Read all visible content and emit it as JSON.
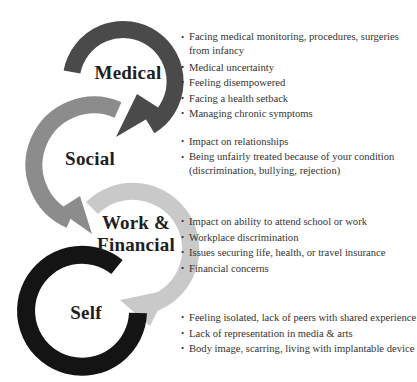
{
  "colors": {
    "medical": "#4a4a4a",
    "social": "#8c8c8c",
    "work_financial": "#c9c9c9",
    "self": "#141414",
    "text": "#333333"
  },
  "sections": [
    {
      "label": "Medical",
      "items": [
        "Facing medical monitoring, procedures, surgeries from infancy",
        "Medical uncertainty",
        "Feeling disempowered",
        "Facing a health setback",
        "Managing chronic symptoms"
      ]
    },
    {
      "label": "Social",
      "items": [
        "Impact on relationships",
        "Being unfairly treated because of your condition (discrimination, bullying, rejection)"
      ]
    },
    {
      "label_line1": "Work &",
      "label_line2": "Financial",
      "items": [
        "Impact on ability to attend school or work",
        "Workplace discrimination",
        "Issues securing life, health, or travel insurance",
        "Financial concerns"
      ]
    },
    {
      "label": "Self",
      "items": [
        "Feeling isolated, lack of peers with shared experience",
        "Lack of representation in media & arts",
        "Body image, scarring, living with implantable device"
      ]
    }
  ],
  "bullet_glyph": "•"
}
